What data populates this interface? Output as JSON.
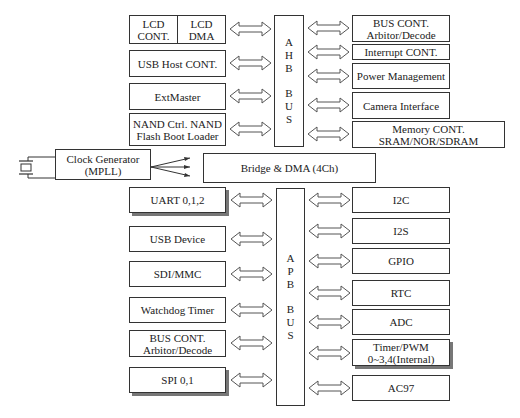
{
  "ahb_bus": {
    "letters": [
      "A",
      "H",
      "B"
    ],
    "letters2": [
      "B",
      "U",
      "S"
    ]
  },
  "apb_bus": {
    "letters": [
      "A",
      "P",
      "B"
    ],
    "letters2": [
      "B",
      "U",
      "S"
    ]
  },
  "ahb_left": {
    "lcd_cont": "LCD CONT.",
    "lcd_dma": "LCD DMA",
    "usb_host": "USB Host CONT.",
    "extmaster": "ExtMaster",
    "nand": "NAND Ctrl. NAND Flash Boot Loader"
  },
  "ahb_right": {
    "bus_cont": "BUS CONT. Arbitor/Decode",
    "interrupt": "Interrupt CONT.",
    "power": "Power Management",
    "camera": "Camera Interface",
    "memory": "Memory CONT. SRAM/NOR/SDRAM"
  },
  "clock": {
    "label": "Clock Generator (MPLL)"
  },
  "bridge": {
    "label": "Bridge & DMA (4Ch)"
  },
  "apb_left": {
    "uart": "UART 0,1,2",
    "usb_device": "USB Device",
    "sdi": "SDI/MMC",
    "watchdog": "Watchdog Timer",
    "bus_cont": "BUS CONT. Arbitor/Decode",
    "spi": "SPI 0,1"
  },
  "apb_right": {
    "i2c": "I2C",
    "i2s": "I2S",
    "gpio": "GPIO",
    "rtc": "RTC",
    "adc": "ADC",
    "timer": "Timer/PWM 0~3,4(Internal)",
    "ac97": "AC97"
  }
}
